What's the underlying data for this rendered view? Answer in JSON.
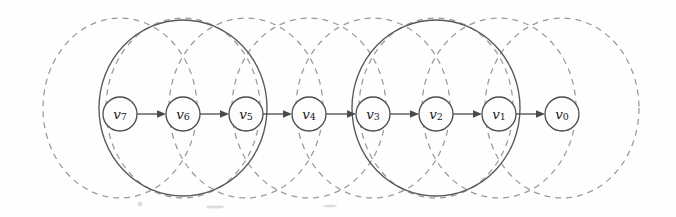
{
  "figure": {
    "background_color": "#fefefe",
    "width": 676,
    "height": 217
  },
  "colors": {
    "node_stroke": "#4c4c50",
    "node_fill": "#fdfdfd",
    "node_label": "#1b1b1f",
    "edge": "#4a4a4e",
    "solid_ellipse": "#58585c",
    "dashed_ellipse": "#9a9a9e"
  },
  "chart_data": {
    "type": "diagram",
    "title": "",
    "nodes": [
      {
        "id": "v7",
        "label_base": "v",
        "label_sub": "7",
        "cx": 120,
        "cy": 114,
        "r": 17
      },
      {
        "id": "v6",
        "label_base": "v",
        "label_sub": "6",
        "cx": 183,
        "cy": 114,
        "r": 17
      },
      {
        "id": "v5",
        "label_base": "v",
        "label_sub": "5",
        "cx": 246,
        "cy": 114,
        "r": 17
      },
      {
        "id": "v4",
        "label_base": "v",
        "label_sub": "4",
        "cx": 309,
        "cy": 114,
        "r": 17
      },
      {
        "id": "v3",
        "label_base": "v",
        "label_sub": "3",
        "cx": 373,
        "cy": 114,
        "r": 17
      },
      {
        "id": "v2",
        "label_base": "v",
        "label_sub": "2",
        "cx": 436,
        "cy": 114,
        "r": 17
      },
      {
        "id": "v1",
        "label_base": "v",
        "label_sub": "1",
        "cx": 499,
        "cy": 114,
        "r": 17
      },
      {
        "id": "v0",
        "label_base": "v",
        "label_sub": "0",
        "cx": 562,
        "cy": 114,
        "r": 17
      }
    ],
    "edges": [
      {
        "from": "v7",
        "to": "v6",
        "directed": true
      },
      {
        "from": "v6",
        "to": "v5",
        "directed": true
      },
      {
        "from": "v5",
        "to": "v4",
        "directed": true
      },
      {
        "from": "v4",
        "to": "v3",
        "directed": true
      },
      {
        "from": "v3",
        "to": "v2",
        "directed": true
      },
      {
        "from": "v2",
        "to": "v1",
        "directed": true
      },
      {
        "from": "v1",
        "to": "v0",
        "directed": true
      }
    ],
    "dashed_ellipses": [
      {
        "around": "v7",
        "cx": 120,
        "cy": 108,
        "rx": 77,
        "ry": 90
      },
      {
        "around": "v6",
        "cx": 183,
        "cy": 108,
        "rx": 77,
        "ry": 90
      },
      {
        "around": "v5",
        "cx": 246,
        "cy": 108,
        "rx": 77,
        "ry": 90
      },
      {
        "around": "v4",
        "cx": 309,
        "cy": 108,
        "rx": 77,
        "ry": 90
      },
      {
        "around": "v3",
        "cx": 373,
        "cy": 108,
        "rx": 77,
        "ry": 90
      },
      {
        "around": "v2",
        "cx": 436,
        "cy": 108,
        "rx": 77,
        "ry": 90
      },
      {
        "around": "v1",
        "cx": 499,
        "cy": 108,
        "rx": 77,
        "ry": 90
      },
      {
        "around": "v0",
        "cx": 562,
        "cy": 108,
        "rx": 77,
        "ry": 90
      }
    ],
    "solid_ellipses": [
      {
        "covers": [
          "v7",
          "v6",
          "v5"
        ],
        "cx": 183,
        "cy": 108,
        "rx": 84,
        "ry": 88
      },
      {
        "covers": [
          "v3",
          "v2",
          "v1"
        ],
        "cx": 436,
        "cy": 108,
        "rx": 84,
        "ry": 88
      }
    ]
  }
}
